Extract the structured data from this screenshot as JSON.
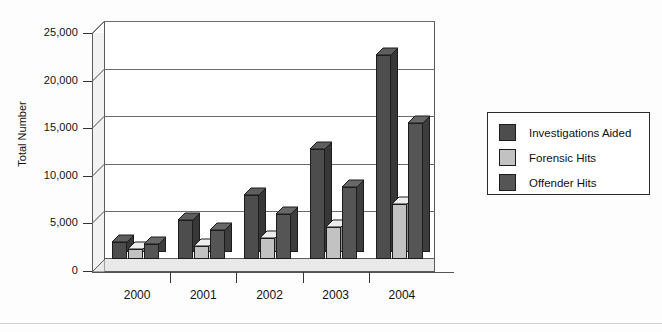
{
  "chart_data": {
    "type": "bar",
    "title": "",
    "subtitle": "",
    "xlabel": "",
    "ylabel": "Total Number",
    "categories": [
      "2000",
      "2001",
      "2002",
      "2003",
      "2004"
    ],
    "series": [
      {
        "name": "Investigations Aided",
        "color": "#4d4d4d",
        "values": [
          1800,
          4100,
          6700,
          11600,
          21400
        ]
      },
      {
        "name": "Forensic Hits",
        "color": "#c2c2c2",
        "values": [
          1000,
          1400,
          2200,
          3400,
          5800
        ]
      },
      {
        "name": "Offender Hits",
        "color": "#555555",
        "values": [
          1550,
          3000,
          4700,
          7600,
          14300
        ]
      }
    ],
    "ylim": [
      0,
      25000
    ],
    "ytick_values": [
      0,
      5000,
      10000,
      15000,
      20000,
      25000
    ],
    "ytick_labels": [
      "0",
      "5,000",
      "10,000",
      "15,000",
      "20,000",
      "25,000"
    ],
    "grid": true,
    "legend_position": "right",
    "three_d": true
  },
  "legend": {
    "items": [
      {
        "label": "Investigations Aided",
        "swatch": "#4d4d4d"
      },
      {
        "label": "Forensic Hits",
        "swatch": "#c2c2c2"
      },
      {
        "label": "Offender Hits",
        "swatch": "#555555"
      }
    ]
  },
  "colors": {
    "investigations_aided": "#4d4d4d",
    "forensic_hits": "#c2c2c2",
    "offender_hits": "#555555",
    "axis": "#333333",
    "gridline": "#6b6b6b",
    "plot_background": "#ffffff",
    "floor": "#e9e9e9",
    "side_wall": "#f2f2f2"
  }
}
